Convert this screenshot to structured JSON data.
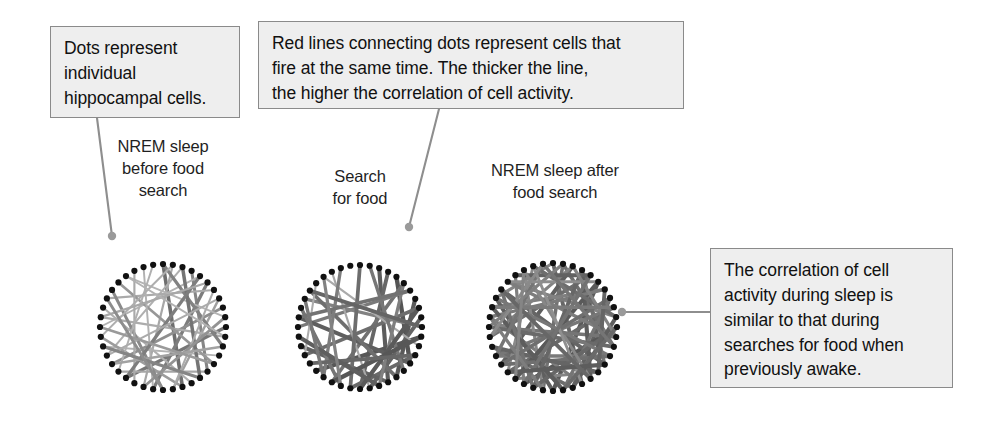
{
  "figure": {
    "background_color": "#ffffff",
    "dot_color": "#111111",
    "leader_color": "#8e8e8e",
    "callout_bg": "#eeeeee",
    "callout_border": "#8a8a8a"
  },
  "callouts": [
    {
      "id": "dots",
      "name": "callout-dots",
      "text": "Dots represent\nindividual\nhippocampal cells.",
      "leader": {
        "from_x": 97,
        "from_y": 118,
        "to_x": 112,
        "to_y": 236
      }
    },
    {
      "id": "redlines",
      "name": "callout-redlines",
      "text": "Red lines connecting dots represent cells that\nfire at the same time. The thicker the line,\nthe higher the correlation of cell activity.",
      "leader": {
        "from_x": 439,
        "from_y": 109,
        "to_x": 409,
        "to_y": 227
      }
    },
    {
      "id": "correlation",
      "name": "callout-correlation",
      "text": "The correlation of cell\nactivity during sleep is\nsimilar to that during\nsearches for food when\npreviously awake.",
      "leader": {
        "from_x": 710,
        "from_y": 312,
        "to_x": 622,
        "to_y": 312
      }
    }
  ],
  "panels": [
    {
      "id": "before",
      "caption": "NREM sleep\nbefore food\nsearch",
      "cx": 163,
      "cy": 327,
      "r": 63,
      "dots": 40
    },
    {
      "id": "search",
      "caption": "Search\nfor food",
      "cx": 360,
      "cy": 327,
      "r": 62,
      "dots": 40
    },
    {
      "id": "after",
      "caption": "NREM sleep after\nfood search",
      "cx": 553,
      "cy": 327,
      "r": 64,
      "dots": 40
    }
  ],
  "chart_data": {
    "type": "diagram",
    "subtype": "chord-network",
    "node_count_per_panel": 40,
    "node_label": "individual hippocampal cell",
    "edge_label": "correlated co-firing between two cells",
    "edge_encoding": {
      "thickness": "higher thickness = higher correlation of cell activity",
      "darkness": "darker gray = higher correlation of cell activity",
      "thickness_range_px": [
        1.2,
        4.6
      ],
      "gray_range": [
        "#cfcfcf",
        "#4a4a4a"
      ]
    },
    "panels": [
      {
        "name": "NREM sleep before food search",
        "edge_count": 34,
        "mean_edge_weight": 0.38,
        "description": "sparse, mostly light/thin chords - low correlation",
        "edges": [
          [
            0,
            18,
            0.72
          ],
          [
            1,
            22,
            0.3
          ],
          [
            2,
            27,
            0.24
          ],
          [
            3,
            15,
            0.55
          ],
          [
            4,
            30,
            0.22
          ],
          [
            5,
            21,
            0.62
          ],
          [
            6,
            33,
            0.28
          ],
          [
            7,
            19,
            0.35
          ],
          [
            8,
            26,
            0.48
          ],
          [
            9,
            36,
            0.2
          ],
          [
            10,
            24,
            0.66
          ],
          [
            11,
            31,
            0.26
          ],
          [
            12,
            0,
            0.58
          ],
          [
            13,
            28,
            0.21
          ],
          [
            14,
            35,
            0.42
          ],
          [
            15,
            25,
            0.3
          ],
          [
            16,
            2,
            0.68
          ],
          [
            17,
            32,
            0.24
          ],
          [
            18,
            29,
            0.38
          ],
          [
            19,
            6,
            0.26
          ],
          [
            20,
            34,
            0.52
          ],
          [
            21,
            38,
            0.22
          ],
          [
            22,
            9,
            0.45
          ],
          [
            23,
            37,
            0.28
          ],
          [
            24,
            4,
            0.61
          ],
          [
            25,
            39,
            0.23
          ],
          [
            26,
            12,
            0.34
          ],
          [
            27,
            7,
            0.27
          ],
          [
            28,
            16,
            0.56
          ],
          [
            29,
            1,
            0.25
          ],
          [
            30,
            14,
            0.4
          ],
          [
            31,
            5,
            0.29
          ],
          [
            33,
            20,
            0.5
          ],
          [
            36,
            11,
            0.22
          ]
        ]
      },
      {
        "name": "Search for food",
        "edge_count": 30,
        "mean_edge_weight": 0.72,
        "description": "fewer chords but thick and dark - high correlation while awake",
        "edges": [
          [
            2,
            17,
            0.86
          ],
          [
            3,
            20,
            0.78
          ],
          [
            4,
            14,
            0.92
          ],
          [
            5,
            23,
            0.7
          ],
          [
            6,
            30,
            0.64
          ],
          [
            7,
            16,
            0.88
          ],
          [
            8,
            27,
            0.74
          ],
          [
            9,
            19,
            0.8
          ],
          [
            10,
            33,
            0.58
          ],
          [
            11,
            25,
            0.9
          ],
          [
            12,
            36,
            0.28
          ],
          [
            13,
            21,
            0.76
          ],
          [
            14,
            31,
            0.84
          ],
          [
            15,
            1,
            0.66
          ],
          [
            16,
            34,
            0.72
          ],
          [
            17,
            28,
            0.82
          ],
          [
            18,
            5,
            0.6
          ],
          [
            19,
            37,
            0.3
          ],
          [
            20,
            8,
            0.88
          ],
          [
            21,
            0,
            0.74
          ],
          [
            22,
            32,
            0.68
          ],
          [
            23,
            11,
            0.9
          ],
          [
            24,
            38,
            0.62
          ],
          [
            26,
            13,
            0.78
          ],
          [
            27,
            35,
            0.26
          ],
          [
            29,
            18,
            0.84
          ],
          [
            31,
            6,
            0.7
          ],
          [
            33,
            24,
            0.66
          ],
          [
            34,
            10,
            0.8
          ],
          [
            36,
            22,
            0.58
          ]
        ]
      },
      {
        "name": "NREM sleep after food search",
        "edge_count": 58,
        "mean_edge_weight": 0.69,
        "description": "dense network of thick dark chords - resembles the awake search state",
        "edges": [
          [
            0,
            17,
            0.78
          ],
          [
            1,
            21,
            0.7
          ],
          [
            2,
            26,
            0.84
          ],
          [
            3,
            14,
            0.66
          ],
          [
            4,
            29,
            0.74
          ],
          [
            5,
            20,
            0.88
          ],
          [
            6,
            32,
            0.6
          ],
          [
            7,
            18,
            0.82
          ],
          [
            8,
            25,
            0.76
          ],
          [
            9,
            35,
            0.58
          ],
          [
            10,
            23,
            0.9
          ],
          [
            11,
            30,
            0.68
          ],
          [
            12,
            1,
            0.72
          ],
          [
            13,
            27,
            0.64
          ],
          [
            14,
            34,
            0.8
          ],
          [
            15,
            24,
            0.56
          ],
          [
            16,
            3,
            0.86
          ],
          [
            17,
            31,
            0.62
          ],
          [
            18,
            28,
            0.74
          ],
          [
            19,
            7,
            0.68
          ],
          [
            20,
            33,
            0.84
          ],
          [
            21,
            37,
            0.54
          ],
          [
            22,
            10,
            0.78
          ],
          [
            23,
            36,
            0.6
          ],
          [
            24,
            5,
            0.88
          ],
          [
            25,
            38,
            0.52
          ],
          [
            26,
            13,
            0.72
          ],
          [
            27,
            8,
            0.66
          ],
          [
            28,
            15,
            0.8
          ],
          [
            29,
            2,
            0.58
          ],
          [
            30,
            12,
            0.76
          ],
          [
            31,
            6,
            0.64
          ],
          [
            32,
            19,
            0.86
          ],
          [
            33,
            0,
            0.56
          ],
          [
            34,
            22,
            0.7
          ],
          [
            35,
            11,
            0.62
          ],
          [
            36,
            4,
            0.82
          ],
          [
            37,
            16,
            0.54
          ],
          [
            38,
            9,
            0.74
          ],
          [
            39,
            27,
            0.68
          ],
          [
            1,
            30,
            0.6
          ],
          [
            3,
            22,
            0.78
          ],
          [
            5,
            35,
            0.5
          ],
          [
            7,
            26,
            0.72
          ],
          [
            9,
            18,
            0.84
          ],
          [
            11,
            2,
            0.58
          ],
          [
            13,
            33,
            0.66
          ],
          [
            15,
            6,
            0.8
          ],
          [
            17,
            38,
            0.48
          ],
          [
            19,
            10,
            0.76
          ],
          [
            21,
            31,
            0.62
          ],
          [
            23,
            4,
            0.7
          ],
          [
            25,
            14,
            0.86
          ],
          [
            29,
            39,
            0.52
          ],
          [
            32,
            8,
            0.64
          ],
          [
            34,
            16,
            0.78
          ],
          [
            37,
            24,
            0.56
          ],
          [
            39,
            12,
            0.68
          ]
        ]
      }
    ]
  }
}
